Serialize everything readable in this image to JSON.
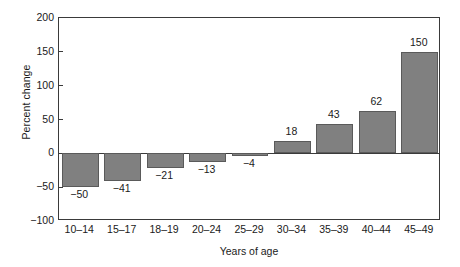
{
  "chart_data": {
    "type": "bar",
    "title": "",
    "subtitle": "",
    "xlabel": "Years of age",
    "ylabel": "Percent change",
    "categories": [
      "10–14",
      "15–17",
      "18–19",
      "20–24",
      "25–29",
      "30–34",
      "35–39",
      "40–44",
      "45–49"
    ],
    "values": [
      -50,
      -41,
      -21,
      -13,
      -4,
      18,
      43,
      62,
      150
    ],
    "value_labels": [
      "−50",
      "−41",
      "−21",
      "−13",
      "−4",
      "18",
      "43",
      "62",
      "150"
    ],
    "ylim": [
      -100,
      200
    ],
    "yticks": [
      200,
      150,
      100,
      50,
      0,
      -50,
      -100
    ],
    "ytick_labels": [
      "200",
      "150",
      "100",
      "50",
      "0",
      "−50",
      "−100"
    ],
    "grid": false,
    "legend": null,
    "legend_position": "none",
    "bar_color": "#808080",
    "bar_edge_color": "#5a5a5a",
    "axis_color": "#3a3a3a",
    "background_color": "#ffffff",
    "text_color": "#1a1a1a",
    "annotations": []
  }
}
